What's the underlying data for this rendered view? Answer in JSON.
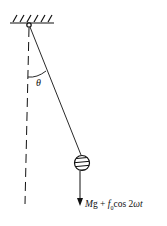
{
  "diagram": {
    "type": "forced pendulum",
    "labels": {
      "angle": "θ",
      "force_prefix": "Mg + ",
      "force_f": "f",
      "force_sub": "0",
      "force_cos": "cos 2",
      "force_omega_t": "ωt"
    },
    "elements": [
      "fixed ceiling support",
      "pivot",
      "string",
      "hatched bob",
      "vertical dashed reference line",
      "angle arc",
      "downward force arrow"
    ],
    "colors": {
      "ink": "#111111",
      "background": "#ffffff"
    }
  }
}
